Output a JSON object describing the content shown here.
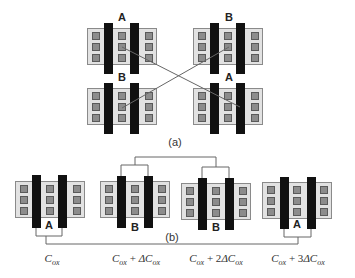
{
  "figure": {
    "part_a": {
      "caption": "(a)",
      "transistors": [
        {
          "id": "a-top-left",
          "label": "A"
        },
        {
          "id": "a-top-right",
          "label": "B"
        },
        {
          "id": "a-bottom-left",
          "label": "B"
        },
        {
          "id": "a-bottom-right",
          "label": "A"
        }
      ],
      "connection": "cross-coupled diagonal wires between A-A and B-B"
    },
    "part_b": {
      "caption": "(b)",
      "transistors": [
        {
          "id": "b-1",
          "label": "A",
          "capacitance": {
            "base": "C",
            "base_sub": "ox",
            "plus": "",
            "delta": ""
          }
        },
        {
          "id": "b-2",
          "label": "B",
          "capacitance": {
            "base": "C",
            "base_sub": "ox",
            "plus": " + ",
            "delta": "ΔC",
            "delta_sub": "ox"
          }
        },
        {
          "id": "b-3",
          "label": "B",
          "capacitance": {
            "base": "C",
            "base_sub": "ox",
            "plus": " + 2",
            "delta": "ΔC",
            "delta_sub": "ox"
          }
        },
        {
          "id": "b-4",
          "label": "A",
          "capacitance": {
            "base": "C",
            "base_sub": "ox",
            "plus": " + 3",
            "delta": "ΔC",
            "delta_sub": "ox"
          }
        }
      ]
    },
    "colors": {
      "active_area": "#e2e2e2",
      "contact": "#8c8c8c",
      "gate": "#111111",
      "wire": "#666666"
    }
  }
}
